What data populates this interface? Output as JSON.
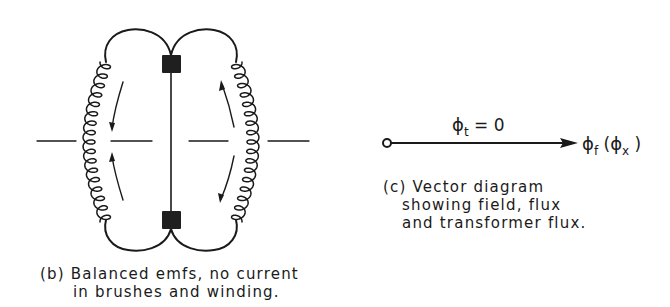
{
  "figure_b": {
    "caption_line1": "(b) Balanced emfs, no current",
    "caption_line2": "in brushes and winding.",
    "elements": {
      "brushes": [
        "top-brush",
        "bottom-brush"
      ],
      "windings": [
        "left-coil",
        "right-coil"
      ],
      "arrows": [
        "left-upper-down",
        "left-lower-up",
        "right-upper-up",
        "right-lower-down"
      ],
      "axis": "horizontal dash-dot neutral axis"
    }
  },
  "figure_c": {
    "top_label_symbol": "ϕ",
    "top_label_sub": "t",
    "top_label_rest": " = 0",
    "end_label_symbol": "ϕ",
    "end_label_sub": "f",
    "end_label_paren_open": " (",
    "end_label_symbol2": "ϕ",
    "end_label_sub2": "x",
    "end_label_paren_close": " )",
    "caption_line1": "(c) Vector diagram",
    "caption_line2": "showing field, flux",
    "caption_line3": "and transformer flux."
  },
  "colors": {
    "ink": "#1a1a1a",
    "background": "#ffffff"
  }
}
